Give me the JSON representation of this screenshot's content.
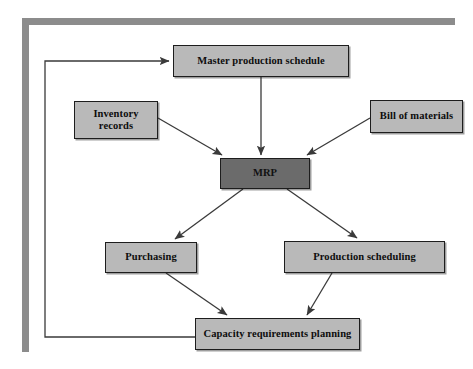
{
  "diagram": {
    "colors": {
      "frame": "#8c8c8c",
      "node_fill": "#b9b9b9",
      "node_fill_dark": "#6b6b6b",
      "node_border": "#1d1d1d",
      "connector": "#3a3a3a",
      "background": "#ffffff"
    },
    "nodes": [
      {
        "id": "master-production-schedule",
        "label": "Master production schedule",
        "x": 173,
        "y": 45,
        "w": 176,
        "h": 32,
        "style": "light"
      },
      {
        "id": "inventory-records",
        "label": "Inventory\nrecords",
        "line1": "Inventory",
        "line2": "records",
        "x": 74,
        "y": 101,
        "w": 84,
        "h": 38,
        "style": "light"
      },
      {
        "id": "bill-of-materials",
        "label": "Bill of materials",
        "x": 370,
        "y": 100,
        "w": 93,
        "h": 33,
        "style": "light"
      },
      {
        "id": "mrp",
        "label": "MRP",
        "x": 220,
        "y": 158,
        "w": 90,
        "h": 31,
        "style": "dark"
      },
      {
        "id": "purchasing",
        "label": "Purchasing",
        "x": 105,
        "y": 242,
        "w": 92,
        "h": 31,
        "style": "light"
      },
      {
        "id": "production-scheduling",
        "label": "Production scheduling",
        "x": 284,
        "y": 241,
        "w": 161,
        "h": 32,
        "style": "light"
      },
      {
        "id": "capacity-requirements-planning",
        "label": "Capacity requirements planning",
        "x": 195,
        "y": 318,
        "w": 165,
        "h": 32,
        "style": "light"
      }
    ],
    "connectors": [
      {
        "id": "mps-to-mrp",
        "from": "master-production-schedule",
        "to": "mrp",
        "arrow": true
      },
      {
        "id": "inventory-to-mrp",
        "from": "inventory-records",
        "to": "mrp",
        "arrow": true
      },
      {
        "id": "bom-to-mrp",
        "from": "bill-of-materials",
        "to": "mrp",
        "arrow": true
      },
      {
        "id": "mrp-to-purchasing",
        "from": "mrp",
        "to": "purchasing",
        "arrow": true
      },
      {
        "id": "mrp-to-production-scheduling",
        "from": "mrp",
        "to": "production-scheduling",
        "arrow": true
      },
      {
        "id": "purchasing-to-capacity",
        "from": "purchasing",
        "to": "capacity-requirements-planning",
        "arrow": true
      },
      {
        "id": "production-scheduling-to-capacity",
        "from": "production-scheduling",
        "to": "capacity-requirements-planning",
        "arrow": true
      },
      {
        "id": "capacity-feedback-to-mps",
        "from": "capacity-requirements-planning",
        "to": "master-production-schedule",
        "arrow": true,
        "routing": "feedback-loop-left"
      }
    ]
  }
}
